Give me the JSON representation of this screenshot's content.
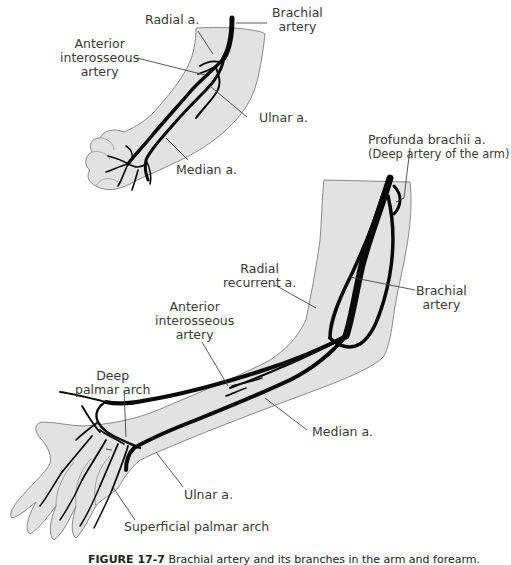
{
  "figure": {
    "caption_label": "FIGURE 17-7",
    "caption_text": "Brachial artery and its branches in the arm and forearm.",
    "colors": {
      "skin": "#e2e2e2",
      "outline": "#8a8a8a",
      "artery": "#0a0a0a",
      "leader": "#444444",
      "text": "#3a3a3a"
    }
  },
  "top_view": {
    "labels": {
      "radial": "Radial a.",
      "brachial_1": "Brachial",
      "brachial_2": "artery",
      "anterior_1": "Anterior",
      "anterior_2": "interosseous",
      "anterior_3": "artery",
      "ulnar": "Ulnar a.",
      "median": "Median a."
    }
  },
  "bottom_view": {
    "labels": {
      "profunda_1": "Profunda brachii a.",
      "profunda_2": "(Deep artery of the arm)",
      "radial_rec_1": "Radial",
      "radial_rec_2": "recurrent a.",
      "brachial_1": "Brachial",
      "brachial_2": "artery",
      "anterior_1": "Anterior",
      "anterior_2": "interosseous",
      "anterior_3": "artery",
      "deep_arch_1": "Deep",
      "deep_arch_2": "palmar arch",
      "median": "Median a.",
      "ulnar": "Ulnar a.",
      "superficial_arch": "Superficial palmar arch"
    }
  }
}
